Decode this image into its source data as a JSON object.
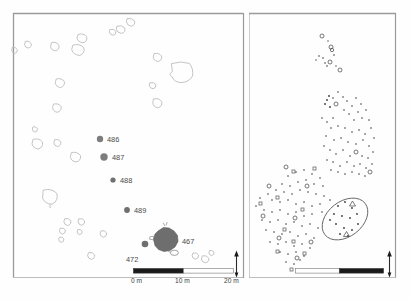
{
  "figure": {
    "background_color": "#fefefe",
    "frame_color": "#9a9a9a"
  },
  "left_panel": {
    "name": "feature-plan-panel",
    "feature_labels": [
      {
        "id": "486",
        "x": 100,
        "y": 139,
        "lx": 107,
        "ly": 141,
        "r": 3.2,
        "color": "#7d7d7d"
      },
      {
        "id": "487",
        "x": 104,
        "y": 157,
        "lx": 111,
        "ly": 159,
        "r": 3.6,
        "color": "#7d7d7d"
      },
      {
        "id": "488",
        "x": 113,
        "y": 180,
        "lx": 120,
        "ly": 182,
        "r": 2.6,
        "color": "#6f6f6f"
      },
      {
        "id": "489",
        "x": 127,
        "y": 210,
        "lx": 134,
        "ly": 212,
        "r": 2.8,
        "color": "#6f6f6f"
      },
      {
        "id": "467",
        "x": 167,
        "y": 241,
        "lx": 182,
        "ly": 241,
        "r": 0,
        "color": "#6e6e6e"
      },
      {
        "id": "472",
        "x": 145,
        "y": 244,
        "lx": 128,
        "ly": 259,
        "r": 3.2,
        "color": "#6f6f6f"
      }
    ],
    "scale_bar": {
      "ticks": [
        "0 m",
        "10 m",
        "20 m"
      ],
      "filled_color": "#1a1a1a",
      "empty_color": "#ffffff",
      "border_color": "#555555"
    },
    "north_arrow": {
      "icon": "north-arrow-icon",
      "label": ""
    },
    "outline_features": [
      {
        "cx": 28,
        "cy": 44,
        "rx": 3.2,
        "ry": 3.6
      },
      {
        "cx": 15,
        "cy": 50,
        "rx": 3.0,
        "ry": 3.2
      },
      {
        "cx": 55,
        "cy": 46,
        "rx": 4.0,
        "ry": 4.2
      },
      {
        "cx": 82,
        "cy": 38,
        "rx": 5.0,
        "ry": 4.6
      },
      {
        "cx": 78,
        "cy": 50,
        "rx": 6.0,
        "ry": 5.6
      },
      {
        "cx": 60,
        "cy": 83,
        "rx": 4.6,
        "ry": 4.4
      },
      {
        "cx": 57,
        "cy": 108,
        "rx": 4.4,
        "ry": 4.2
      },
      {
        "cx": 35,
        "cy": 129,
        "rx": 2.6,
        "ry": 2.8
      },
      {
        "cx": 121,
        "cy": 29,
        "rx": 4.6,
        "ry": 4.0
      },
      {
        "cx": 131,
        "cy": 22,
        "rx": 4.4,
        "ry": 4.2
      },
      {
        "cx": 113,
        "cy": 32,
        "rx": 3.6,
        "ry": 3.2
      },
      {
        "cx": 158,
        "cy": 57,
        "rx": 4.4,
        "ry": 4.2
      },
      {
        "cx": 182,
        "cy": 72,
        "rx": 11.0,
        "ry": 10.0
      },
      {
        "cx": 153,
        "cy": 86,
        "rx": 3.4,
        "ry": 3.2
      },
      {
        "cx": 158,
        "cy": 103,
        "rx": 5.0,
        "ry": 4.6
      },
      {
        "cx": 38,
        "cy": 144,
        "rx": 5.4,
        "ry": 5.0
      },
      {
        "cx": 58,
        "cy": 143,
        "rx": 3.6,
        "ry": 3.8
      },
      {
        "cx": 76,
        "cy": 157,
        "rx": 5.2,
        "ry": 5.0
      },
      {
        "cx": 50,
        "cy": 197,
        "rx": 7.8,
        "ry": 7.4
      },
      {
        "cx": 68,
        "cy": 222,
        "rx": 3.6,
        "ry": 3.4
      },
      {
        "cx": 63,
        "cy": 231,
        "rx": 3.2,
        "ry": 3.0
      },
      {
        "cx": 82,
        "cy": 222,
        "rx": 3.4,
        "ry": 3.2
      },
      {
        "cx": 80,
        "cy": 232,
        "rx": 2.6,
        "ry": 2.6
      },
      {
        "cx": 62,
        "cy": 240,
        "rx": 2.8,
        "ry": 2.8
      },
      {
        "cx": 104,
        "cy": 234,
        "rx": 3.0,
        "ry": 3.2
      },
      {
        "cx": 92,
        "cy": 256,
        "rx": 3.4,
        "ry": 3.4
      },
      {
        "cx": 196,
        "cy": 256,
        "rx": 3.2,
        "ry": 3.0
      },
      {
        "cx": 206,
        "cy": 259,
        "rx": 3.6,
        "ry": 3.2
      },
      {
        "cx": 212,
        "cy": 253,
        "rx": 2.6,
        "ry": 2.6
      }
    ]
  },
  "right_panel": {
    "name": "artefact-distribution-panel",
    "scale_bar": {
      "filled_color": "#1a1a1a",
      "empty_color": "#ffffff",
      "border_color": "#555555",
      "ticks": []
    },
    "north_arrow": {
      "icon": "north-arrow-icon",
      "label": ""
    },
    "ellipse_annotation": {
      "cx": 345,
      "cy": 219,
      "rx": 25,
      "ry": 17,
      "rotation": -35
    }
  }
}
